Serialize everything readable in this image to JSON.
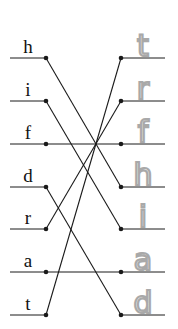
{
  "worksheet": {
    "left_column": {
      "letters": [
        "h",
        "i",
        "f",
        "d",
        "r",
        "a",
        "t"
      ],
      "row_y": [
        58,
        101,
        144,
        187,
        229,
        272,
        315
      ]
    },
    "right_column": {
      "handwritten_letters": [
        "t",
        "r",
        "f",
        "h",
        "i",
        "a",
        "d"
      ],
      "row_y": [
        58,
        101,
        144,
        187,
        229,
        272,
        315
      ],
      "ink_color": "#a9a9a9"
    },
    "connections": [
      {
        "from": "h",
        "from_row": 0,
        "to_row": 3
      },
      {
        "from": "i",
        "from_row": 1,
        "to_row": 4
      },
      {
        "from": "f",
        "from_row": 2,
        "to_row": 2
      },
      {
        "from": "d",
        "from_row": 3,
        "to_row": 6
      },
      {
        "from": "r",
        "from_row": 4,
        "to_row": 1
      },
      {
        "from": "a",
        "from_row": 5,
        "to_row": 5
      },
      {
        "from": "t",
        "from_row": 6,
        "to_row": 0
      }
    ],
    "line_color": "#1a1a1a"
  }
}
